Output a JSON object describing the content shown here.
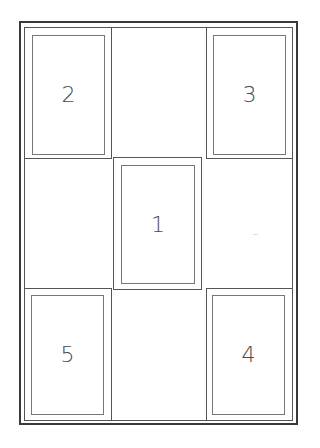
{
  "diagram": {
    "type": "layout-grid",
    "rows": 3,
    "columns": 3,
    "panels": [
      {
        "label": "1",
        "position": "center"
      },
      {
        "label": "2",
        "position": "top-left"
      },
      {
        "label": "3",
        "position": "top-right"
      },
      {
        "label": "4",
        "position": "bottom-right"
      },
      {
        "label": "5",
        "position": "bottom-left"
      }
    ],
    "colors": {
      "border": "#3a3a3a",
      "line": "#555555",
      "text": "#4a4a4a"
    }
  }
}
